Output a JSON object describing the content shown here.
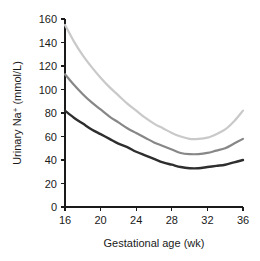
{
  "chart_data": {
    "type": "line",
    "title": "",
    "xlabel": "Gestational age (wk)",
    "ylabel": "Urinary Na+ (mmol/L)",
    "ylabel_parts": {
      "prefix": "Urinary Na",
      "superscript": "+",
      "suffix": " (mmol/L)"
    },
    "xlim": [
      16,
      36
    ],
    "ylim": [
      0,
      160
    ],
    "xticks": [
      16,
      20,
      24,
      28,
      32,
      36
    ],
    "xtick_labels": [
      "16",
      "20",
      "24",
      "28",
      "32",
      "36"
    ],
    "yticks": [
      0,
      20,
      40,
      60,
      80,
      100,
      120,
      140,
      160
    ],
    "ytick_labels": [
      "0",
      "20",
      "40",
      "60",
      "80",
      "100",
      "120",
      "140",
      "160"
    ],
    "grid": false,
    "legend": "none",
    "x": [
      16,
      17,
      18,
      19,
      20,
      21,
      22,
      23,
      24,
      25,
      26,
      27,
      28,
      29,
      30,
      31,
      32,
      33,
      34,
      35,
      36
    ],
    "series": [
      {
        "name": "upper-percentile",
        "color": "#c9c9c9",
        "width": 2.2,
        "values": [
          155,
          141,
          129,
          119,
          110,
          102,
          95,
          88,
          82,
          76,
          71,
          67,
          63,
          60,
          58,
          58,
          59,
          62,
          66,
          73,
          82
        ]
      },
      {
        "name": "median-percentile",
        "color": "#878787",
        "width": 2.2,
        "values": [
          113,
          104,
          96,
          89,
          83,
          77,
          72,
          67,
          63,
          59,
          55,
          52,
          49,
          46,
          45,
          45,
          46,
          48,
          50,
          54,
          58
        ]
      },
      {
        "name": "lower-percentile",
        "color": "#2e2e2e",
        "width": 2.4,
        "values": [
          82,
          76,
          71,
          66,
          62,
          58,
          54,
          51,
          47,
          44,
          41,
          38,
          36,
          34,
          33,
          33,
          34,
          35,
          36,
          38,
          40
        ]
      }
    ]
  },
  "plot_geometry": {
    "left": 65,
    "right": 243,
    "top": 19,
    "bottom": 207
  }
}
